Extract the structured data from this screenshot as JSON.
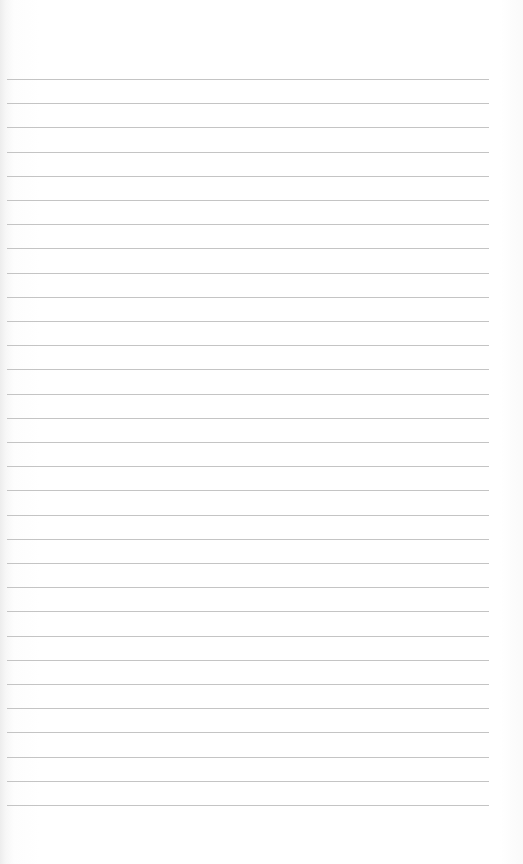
{
  "paper": {
    "type": "lined-paper",
    "line_count": 31,
    "first_line_y": 79,
    "line_spacing": 24.2,
    "line_left": 7,
    "line_right": 489,
    "line_color": "#c4c4c4",
    "background_color": "#fdfdfd"
  }
}
